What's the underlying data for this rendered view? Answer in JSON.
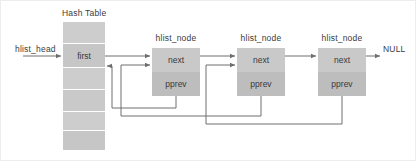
{
  "diagram": {
    "title_hash_table": "Hash Table",
    "label_hlist_head": "hlist_head",
    "label_null": "NULL",
    "hash_table": {
      "first_cell_label": "first",
      "cell_count": 6,
      "first_cell_index": 1,
      "fill": "#c9c9c9",
      "fill_alt": "#cfcfcf"
    },
    "nodes": [
      {
        "title": "hlist_node",
        "next_label": "next",
        "pprev_label": "pprev"
      },
      {
        "title": "hlist_node",
        "next_label": "next",
        "pprev_label": "pprev"
      },
      {
        "title": "hlist_node",
        "next_label": "next",
        "pprev_label": "pprev"
      }
    ],
    "colors": {
      "next_fill": "#c9c9c9",
      "pprev_fill": "#bdbdbd",
      "line": "#6e6e6e",
      "text": "#3a3a3a",
      "frame": "#e6e6e6"
    }
  }
}
